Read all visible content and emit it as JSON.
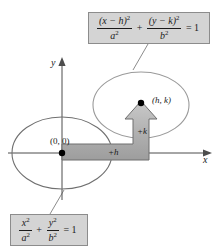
{
  "figure": {
    "background_color": "#ffffff"
  },
  "callouts": {
    "translated_equation": {
      "name": "translated-ellipse-equation",
      "numerator_left": "(x − h)",
      "numerator_left_exponent": "2",
      "denominator_left": "a",
      "denominator_left_exponent": "2",
      "operator": "+",
      "numerator_right": "(y − k)",
      "numerator_right_exponent": "2",
      "denominator_right": "b",
      "denominator_right_exponent": "2",
      "equals": "= 1",
      "fill_color": "#d4d4d4",
      "border_color": "#8c8c8c"
    },
    "standard_equation": {
      "name": "standard-ellipse-equation",
      "numerator_left": "x",
      "numerator_left_exponent": "2",
      "denominator_left": "a",
      "denominator_left_exponent": "2",
      "operator": "+",
      "numerator_right": "y",
      "numerator_right_exponent": "2",
      "denominator_right": "b",
      "denominator_right_exponent": "2",
      "equals": "= 1",
      "fill_color": "#d4d4d4",
      "border_color": "#8c8c8c"
    }
  },
  "axes": {
    "x_label": "x",
    "y_label": "y",
    "color": "#4d4d4d"
  },
  "points": {
    "origin_label": "(0, 0)",
    "center_label": "(h, k)",
    "marker_color": "#000000"
  },
  "shifts": {
    "horizontal_label": "+h",
    "vertical_label": "+k",
    "arrow_fill": "#b3b3b3",
    "arrow_stroke": "#6e6e6e"
  },
  "ellipses": {
    "origin_ellipse_name": "ellipse-at-origin",
    "translated_ellipse_name": "ellipse-at-h-k",
    "stroke_color": "#707070"
  }
}
